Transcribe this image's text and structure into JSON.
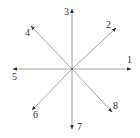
{
  "diagram": {
    "type": "direction-vectors",
    "center": {
      "x": 72,
      "y": 69
    },
    "colors": {
      "line": "#9a9a9a",
      "arrowhead": "#333333",
      "label": "#333333",
      "background": "#ffffff"
    },
    "directions": [
      {
        "label": "1",
        "angle_deg": 0,
        "tip": {
          "x": 131,
          "y": 69
        },
        "label_pos": {
          "x": 127,
          "y": 63
        }
      },
      {
        "label": "2",
        "angle_deg": 45,
        "tip": {
          "x": 116,
          "y": 28
        },
        "label_pos": {
          "x": 106,
          "y": 28
        }
      },
      {
        "label": "3",
        "angle_deg": 90,
        "tip": {
          "x": 72,
          "y": 9
        },
        "label_pos": {
          "x": 64,
          "y": 15
        }
      },
      {
        "label": "4",
        "angle_deg": 135,
        "tip": {
          "x": 31,
          "y": 26
        },
        "label_pos": {
          "x": 25,
          "y": 36
        }
      },
      {
        "label": "5",
        "angle_deg": 180,
        "tip": {
          "x": 13,
          "y": 69
        },
        "label_pos": {
          "x": 12,
          "y": 80
        }
      },
      {
        "label": "6",
        "angle_deg": 225,
        "tip": {
          "x": 32,
          "y": 110
        },
        "label_pos": {
          "x": 33,
          "y": 118
        }
      },
      {
        "label": "7",
        "angle_deg": 270,
        "tip": {
          "x": 72,
          "y": 129
        },
        "label_pos": {
          "x": 77,
          "y": 130
        }
      },
      {
        "label": "8",
        "angle_deg": 315,
        "tip": {
          "x": 112,
          "y": 112
        },
        "label_pos": {
          "x": 113,
          "y": 109
        }
      }
    ]
  }
}
